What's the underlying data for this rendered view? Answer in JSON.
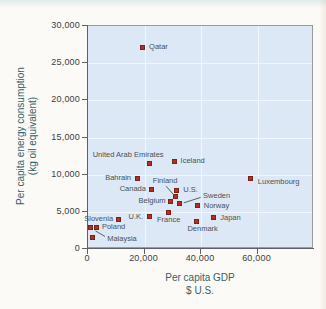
{
  "figure": {
    "colors": {
      "plot_background": "#dce8f5",
      "gridline": "#f0f6fc",
      "marker_fill": "#ae3127",
      "marker_edge": "#7e211b",
      "frame": "#989c9f",
      "axis_line": "#5e6266",
      "tick_label": "#3e3f41",
      "axis_title": "#34616c",
      "point_label": "#4b5156"
    }
  },
  "chart_data": {
    "type": "scatter",
    "title": "",
    "xlabel": "Per capita GDP",
    "xlabel_sub": "$ U.S.",
    "ylabel": "Per capita energy consumption",
    "ylabel_sub": "(kg oil equivalent)",
    "xlim": [
      0,
      80000
    ],
    "ylim": [
      0,
      30000
    ],
    "grid": true,
    "x_ticks": [
      {
        "value": 0,
        "label": "0"
      },
      {
        "value": 20000,
        "label": "20,000"
      },
      {
        "value": 40000,
        "label": "40,000"
      },
      {
        "value": 60000,
        "label": "60,000"
      }
    ],
    "y_ticks": [
      {
        "value": 0,
        "label": "0"
      },
      {
        "value": 5000,
        "label": "5,000"
      },
      {
        "value": 10000,
        "label": "10,000"
      },
      {
        "value": 15000,
        "label": "15,000"
      },
      {
        "value": 20000,
        "label": "20,000"
      },
      {
        "value": 25000,
        "label": "25,000"
      },
      {
        "value": 30000,
        "label": "30,000"
      }
    ],
    "points": [
      {
        "label": "Qatar",
        "gdp": 19500,
        "energy": 27000,
        "label_anchor": "start",
        "label_dx": 7,
        "label_dy": 0
      },
      {
        "label": "United Arab Emirates",
        "gdp": 22000,
        "energy": 11400,
        "label_anchor": "middle",
        "label_dx": -21,
        "label_dy": -8.5
      },
      {
        "label": "Iceland",
        "gdp": 31000,
        "energy": 11700,
        "label_anchor": "start",
        "label_dx": 6,
        "label_dy": 0
      },
      {
        "label": "Bahrain",
        "gdp": 17700,
        "energy": 9400,
        "label_anchor": "end",
        "label_dx": -6,
        "label_dy": 0
      },
      {
        "label": "Luxembourg",
        "gdp": 58000,
        "energy": 9400,
        "label_anchor": "start",
        "label_dx": 7,
        "label_dy": 4
      },
      {
        "label": "Canada",
        "gdp": 23000,
        "energy": 7900,
        "label_anchor": "end",
        "label_dx": -6,
        "label_dy": 0
      },
      {
        "label": "U.S.",
        "gdp": 31600,
        "energy": 7700,
        "label_anchor": "start",
        "label_dx": 7,
        "label_dy": -1
      },
      {
        "label": "Finland",
        "gdp": 31200,
        "energy": 6900,
        "label_anchor": "middle",
        "label_dx": -10,
        "label_dy": -16,
        "callout": {
          "dx1": -9,
          "dy1": -10.5,
          "dx2": -1.5,
          "dy2": -2
        }
      },
      {
        "label": "Belgium",
        "gdp": 29600,
        "energy": 6300,
        "label_anchor": "end",
        "label_dx": -5,
        "label_dy": 0
      },
      {
        "label": "Sweden",
        "gdp": 32800,
        "energy": 6000,
        "label_anchor": "middle",
        "label_dx": 37,
        "label_dy": -7.5,
        "callout": {
          "dx1": 21,
          "dy1": -6,
          "dx2": 4,
          "dy2": -0.5
        }
      },
      {
        "label": "Norway",
        "gdp": 39200,
        "energy": 5700,
        "label_anchor": "start",
        "label_dx": 6,
        "label_dy": 0
      },
      {
        "label": "France",
        "gdp": 28900,
        "energy": 4800,
        "label_anchor": "middle",
        "label_dx": 0,
        "label_dy": 8
      },
      {
        "label": "U.K.",
        "gdp": 22000,
        "energy": 4300,
        "label_anchor": "end",
        "label_dx": -6,
        "label_dy": 1
      },
      {
        "label": "Japan",
        "gdp": 44700,
        "energy": 4100,
        "label_anchor": "start",
        "label_dx": 7,
        "label_dy": 0
      },
      {
        "label": "Denmark",
        "gdp": 38800,
        "energy": 3500,
        "label_anchor": "middle",
        "label_dx": 6,
        "label_dy": 7
      },
      {
        "label": "Slovenia",
        "gdp": 11000,
        "energy": 3900,
        "label_anchor": "end",
        "label_dx": -5,
        "label_dy": 0
      },
      {
        "label": "Poland",
        "gdp": 3500,
        "energy": 2700,
        "label_anchor": "start",
        "label_dx": 5,
        "label_dy": -1
      },
      {
        "label": "Malaysia",
        "gdp": 1400,
        "energy": 2700,
        "label_anchor": "middle",
        "label_dx": 31,
        "label_dy": 11,
        "callout": {
          "dx1": 14,
          "dy1": 8.5,
          "dx2": 4.5,
          "dy2": 3
        }
      },
      {
        "label": "",
        "gdp": 1800,
        "energy": 1400
      }
    ]
  }
}
